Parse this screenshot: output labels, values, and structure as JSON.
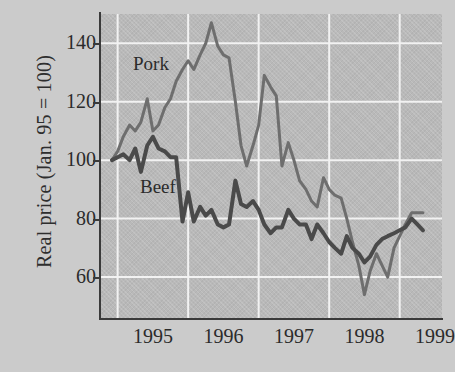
{
  "chart_data": {
    "type": "line",
    "title": "",
    "xlabel": "",
    "ylabel": "Real price (Jan. 95 = 100)",
    "xlim": [
      1994.75,
      1999.6
    ],
    "ylim": [
      46,
      150
    ],
    "ytick_values": [
      140,
      120,
      100,
      80,
      60
    ],
    "ytick_labels": [
      "140",
      "120",
      "100",
      "80",
      "60"
    ],
    "xtick_values": [
      1995,
      1996,
      1997,
      1998,
      1999
    ],
    "xtick_labels": [
      "1995",
      "1996",
      "1997",
      "1998",
      "1999"
    ],
    "grid": true,
    "grid_color": "#f2f2f2",
    "legend_position": "inline-annotation",
    "plot_bgcolor": "#b9b9b9",
    "page_bgcolor": "#cbcbcb",
    "annotations": [
      {
        "text": "Pork",
        "series": "Pork",
        "x": 1995.3,
        "y": 132
      },
      {
        "text": "Beef",
        "series": "Beef",
        "x": 1995.4,
        "y": 88
      }
    ],
    "series": [
      {
        "name": "Pork",
        "color": "#6e6e6e",
        "line_width": 3,
        "x": [
          1994.92,
          1995.0,
          1995.08,
          1995.17,
          1995.25,
          1995.33,
          1995.42,
          1995.5,
          1995.58,
          1995.67,
          1995.75,
          1995.83,
          1995.92,
          1996.0,
          1996.08,
          1996.17,
          1996.25,
          1996.33,
          1996.42,
          1996.5,
          1996.58,
          1996.67,
          1996.75,
          1996.83,
          1996.92,
          1997.0,
          1997.08,
          1997.17,
          1997.25,
          1997.33,
          1997.42,
          1997.5,
          1997.58,
          1997.67,
          1997.75,
          1997.83,
          1997.92,
          1998.0,
          1998.08,
          1998.17,
          1998.25,
          1998.33,
          1998.42,
          1998.5,
          1998.58,
          1998.67,
          1998.75,
          1998.83,
          1998.92,
          1999.0,
          1999.08,
          1999.17,
          1999.25,
          1999.33
        ],
        "y": [
          100,
          103,
          108,
          112,
          110,
          113,
          121,
          110,
          112,
          118,
          121,
          127,
          131,
          134,
          131,
          136,
          140,
          147,
          139,
          136,
          135,
          120,
          105,
          98,
          105,
          112,
          129,
          125,
          122,
          98,
          106,
          100,
          93,
          90,
          86,
          84,
          94,
          90,
          88,
          87,
          80,
          72,
          64,
          54,
          62,
          68,
          64,
          60,
          70,
          74,
          78,
          82,
          82,
          82
        ]
      },
      {
        "name": "Beef",
        "color": "#4a4a4a",
        "line_width": 4,
        "x": [
          1994.92,
          1995.0,
          1995.08,
          1995.17,
          1995.25,
          1995.33,
          1995.42,
          1995.5,
          1995.58,
          1995.67,
          1995.75,
          1995.83,
          1995.92,
          1996.0,
          1996.08,
          1996.17,
          1996.25,
          1996.33,
          1996.42,
          1996.5,
          1996.58,
          1996.67,
          1996.75,
          1996.83,
          1996.92,
          1997.0,
          1997.08,
          1997.17,
          1997.25,
          1997.33,
          1997.42,
          1997.5,
          1997.58,
          1997.67,
          1997.75,
          1997.83,
          1997.92,
          1998.0,
          1998.08,
          1998.17,
          1998.25,
          1998.33,
          1998.42,
          1998.5,
          1998.58,
          1998.67,
          1998.75,
          1998.83,
          1998.92,
          1999.0,
          1999.08,
          1999.17,
          1999.25,
          1999.33
        ],
        "y": [
          100,
          101,
          102,
          100,
          104,
          96,
          105,
          108,
          104,
          103,
          101,
          101,
          79,
          89,
          79,
          84,
          81,
          83,
          78,
          77,
          78,
          93,
          85,
          84,
          86,
          83,
          78,
          75,
          77,
          77,
          83,
          80,
          78,
          78,
          73,
          78,
          75,
          72,
          70,
          68,
          74,
          70,
          68,
          65,
          67,
          71,
          73,
          74,
          75,
          76,
          77,
          80,
          78,
          76
        ]
      }
    ]
  },
  "axis": {
    "ylabel": "Real price (Jan. 95 = 100)"
  }
}
